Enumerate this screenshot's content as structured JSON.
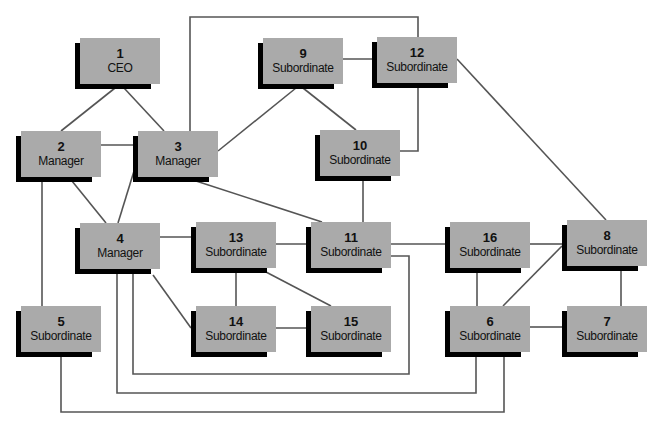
{
  "diagram": {
    "colors": {
      "box": "#aaaaaa",
      "shadow": "#000000",
      "line": "#555555",
      "text": "#111111"
    },
    "nodes": [
      {
        "id": "1",
        "role": "CEO",
        "x": 80,
        "y": 38
      },
      {
        "id": "2",
        "role": "Manager",
        "x": 21,
        "y": 131
      },
      {
        "id": "3",
        "role": "Manager",
        "x": 138,
        "y": 131
      },
      {
        "id": "9",
        "role": "Subordinate",
        "x": 263,
        "y": 38
      },
      {
        "id": "12",
        "role": "Subordinate",
        "x": 377,
        "y": 37
      },
      {
        "id": "10",
        "role": "Subordinate",
        "x": 320,
        "y": 130
      },
      {
        "id": "4",
        "role": "Manager",
        "x": 80,
        "y": 223
      },
      {
        "id": "13",
        "role": "Subordinate",
        "x": 196,
        "y": 222
      },
      {
        "id": "11",
        "role": "Subordinate",
        "x": 311,
        "y": 222
      },
      {
        "id": "16",
        "role": "Subordinate",
        "x": 450,
        "y": 222
      },
      {
        "id": "8",
        "role": "Subordinate",
        "x": 567,
        "y": 220
      },
      {
        "id": "5",
        "role": "Subordinate",
        "x": 21,
        "y": 306
      },
      {
        "id": "14",
        "role": "Subordinate",
        "x": 196,
        "y": 306
      },
      {
        "id": "15",
        "role": "Subordinate",
        "x": 311,
        "y": 306
      },
      {
        "id": "6",
        "role": "Subordinate",
        "x": 450,
        "y": 306
      },
      {
        "id": "7",
        "role": "Subordinate",
        "x": 567,
        "y": 306
      }
    ],
    "links": [
      {
        "from": "1",
        "to": "2",
        "path": "M115 88 L61 131"
      },
      {
        "from": "1",
        "to": "3",
        "path": "M124 88 L164 131"
      },
      {
        "from": "2",
        "to": "3",
        "path": "M101 145 L138 145"
      },
      {
        "from": "2",
        "to": "4",
        "path": "M72 181 L106 223"
      },
      {
        "from": "2",
        "to": "5",
        "path": "M42 181 L42 306"
      },
      {
        "from": "3",
        "to": "4",
        "path": "M138 158 L118 223"
      },
      {
        "from": "3",
        "to": "9",
        "path": "M218 151 L296 88"
      },
      {
        "from": "3",
        "to": "12",
        "path": "M190 131 L190 17 L418 17 L418 37"
      },
      {
        "from": "3",
        "to": "11",
        "path": "M196 181 L322 222"
      },
      {
        "from": "9",
        "to": "12",
        "path": "M343 59 L377 59"
      },
      {
        "from": "9",
        "to": "10",
        "path": "M303 88 L356 130"
      },
      {
        "from": "12",
        "to": "10",
        "path": "M418 87 L418 151 L400 151"
      },
      {
        "from": "10",
        "to": "11",
        "path": "M363 180 L363 222"
      },
      {
        "from": "4",
        "to": "13",
        "path": "M160 237 L196 237"
      },
      {
        "from": "4",
        "to": "14",
        "path": "M153 275 L191 328"
      },
      {
        "from": "13",
        "to": "11",
        "path": "M276 244 L311 244"
      },
      {
        "from": "13",
        "to": "14",
        "path": "M236 272 L236 306"
      },
      {
        "from": "13",
        "to": "15",
        "path": "M266 272 L331 306"
      },
      {
        "from": "14",
        "to": "15",
        "path": "M276 328 L311 328"
      },
      {
        "from": "11",
        "to": "16",
        "path": "M391 244 L450 244"
      },
      {
        "from": "4",
        "to": "11",
        "path": "M133 273 L133 374 L409 374 L409 256 L391 256"
      },
      {
        "from": "4",
        "to": "6",
        "path": "M117 273 L117 393 L476 393 L476 356"
      },
      {
        "from": "5",
        "to": "6",
        "path": "M61 356 L61 412 L504 412 L504 356"
      },
      {
        "from": "16",
        "to": "8",
        "path": "M530 244 L562 244"
      },
      {
        "from": "16",
        "to": "6",
        "path": "M477 272 L477 306"
      },
      {
        "from": "6",
        "to": "8",
        "path": "M503 306 L562 246"
      },
      {
        "from": "6",
        "to": "7",
        "path": "M530 327 L562 327"
      },
      {
        "from": "12",
        "to": "8",
        "path": "M457 59 L606 220"
      },
      {
        "from": "8",
        "to": "7",
        "path": "M621 270 L621 306"
      }
    ]
  }
}
